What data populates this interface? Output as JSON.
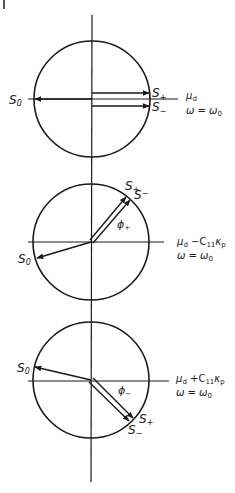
{
  "figure": {
    "colors": {
      "ink": "#1a1a1a",
      "background": "#ffffff"
    },
    "axis": {
      "vertical_x": 92,
      "top": 15,
      "bottom": 482
    },
    "panels": [
      {
        "id": "panel-1",
        "center": [
          92,
          99
        ],
        "radius": 58,
        "labels": {
          "s0": "S",
          "s0_sub": "0",
          "s_plus": "S",
          "s_plus_sub": "+",
          "s_minus": "S",
          "s_minus_sub": "−",
          "mu": "μ",
          "mu_sub": "d",
          "omega": "ω = ω",
          "omega_sub": "0"
        }
      },
      {
        "id": "panel-2",
        "center": [
          91,
          243
        ],
        "radius": 58,
        "labels": {
          "s0": "S",
          "s0_sub": "0",
          "s_plus": "S",
          "s_plus_sub": "+",
          "s_minus": "S",
          "s_minus_sub": "−",
          "phi": "ϕ",
          "phi_sub": "+",
          "mu": "μ",
          "mu_sub": "d",
          "mu_extra": " −C",
          "mu_extra_sub": "11",
          "kappa": "κ",
          "kappa_sub": "p",
          "omega": "ω = ω",
          "omega_sub": "0"
        }
      },
      {
        "id": "panel-3",
        "center": [
          91,
          380
        ],
        "radius": 58,
        "labels": {
          "s0": "S",
          "s0_sub": "0",
          "s_plus": "S",
          "s_plus_sub": "+",
          "s_minus": "S",
          "s_minus_sub": "−",
          "phi": "ϕ",
          "phi_sub": "−",
          "mu": "μ",
          "mu_sub": "d",
          "mu_extra": " +C",
          "mu_extra_sub": "11",
          "kappa": "κ",
          "kappa_sub": "p",
          "omega": "ω = ω",
          "omega_sub": "0"
        }
      }
    ]
  }
}
